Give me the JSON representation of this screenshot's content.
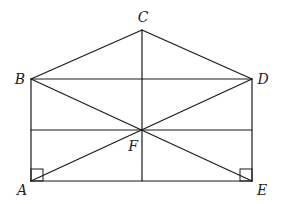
{
  "diagram": {
    "type": "geometry-figure",
    "stroke_color": "#1a1a1a",
    "points": [
      {
        "id": "C",
        "label": "C",
        "x": 142,
        "y": 30,
        "label_x": 143,
        "label_y": 22,
        "anchor": "middle"
      },
      {
        "id": "B",
        "label": "B",
        "x": 31,
        "y": 79,
        "label_x": 20,
        "label_y": 84,
        "anchor": "middle"
      },
      {
        "id": "D",
        "label": "D",
        "x": 252,
        "y": 79,
        "label_x": 263,
        "label_y": 84,
        "anchor": "middle"
      },
      {
        "id": "F",
        "label": "F",
        "x": 142,
        "y": 130,
        "label_x": 133,
        "label_y": 151,
        "anchor": "middle"
      },
      {
        "id": "A",
        "label": "A",
        "x": 31,
        "y": 181,
        "label_x": 22,
        "label_y": 195,
        "anchor": "middle"
      },
      {
        "id": "E",
        "label": "E",
        "x": 252,
        "y": 181,
        "label_x": 262,
        "label_y": 195,
        "anchor": "middle"
      }
    ],
    "segments": [
      {
        "name": "segment-CB",
        "from": "C",
        "to": "B"
      },
      {
        "name": "segment-CD",
        "from": "C",
        "to": "D"
      },
      {
        "name": "segment-BD",
        "from": "B",
        "to": "D"
      },
      {
        "name": "segment-BA",
        "from": "B",
        "to": "A"
      },
      {
        "name": "segment-DE",
        "from": "D",
        "to": "E"
      },
      {
        "name": "segment-AE",
        "from": "A",
        "to": "E"
      },
      {
        "name": "segment-BE",
        "from": "B",
        "to": "E"
      },
      {
        "name": "segment-AD",
        "from": "A",
        "to": "D"
      },
      {
        "name": "segment-C-vertical",
        "x1": 142,
        "y1": 30,
        "x2": 142,
        "y2": 181
      },
      {
        "name": "segment-horizontal-through-F",
        "x1": 31,
        "y1": 130,
        "x2": 252,
        "y2": 130
      }
    ],
    "right_angles": [
      {
        "at": "A",
        "x": 31,
        "y": 169,
        "size": 12
      },
      {
        "at": "E",
        "x": 240,
        "y": 169,
        "size": 12
      }
    ]
  }
}
